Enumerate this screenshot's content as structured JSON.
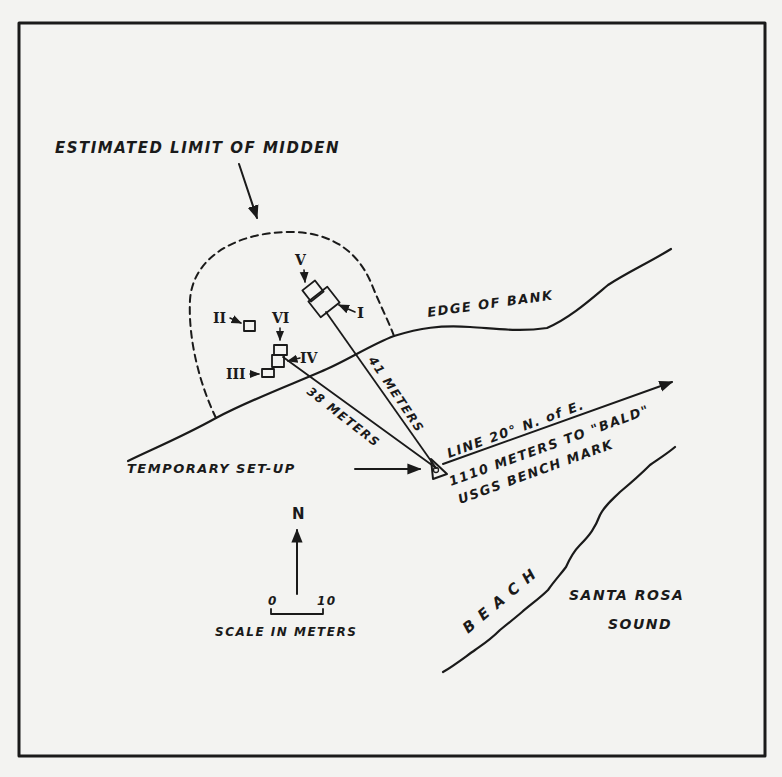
{
  "map": {
    "title_label": "ESTIMATED LIMIT OF MIDDEN",
    "bank_label": "EDGE OF BANK",
    "setup_label": "TEMPORARY SET-UP",
    "line_label": "LINE 20° N. of E.",
    "distance_label_1": "1110 METERS TO \"BALD\"",
    "distance_label_2": "USGS BENCH MARK",
    "measure_41": "41 METERS",
    "measure_38": "38 METERS",
    "beach_label": "B E A C H",
    "water_label_1": "SANTA ROSA",
    "water_label_2": "SOUND",
    "north_label": "N",
    "scale_zero": "0",
    "scale_ten": "10",
    "scale_label": "SCALE IN METERS",
    "units": [
      {
        "id": "I",
        "label": "I"
      },
      {
        "id": "II",
        "label": "II"
      },
      {
        "id": "III",
        "label": "III"
      },
      {
        "id": "IV",
        "label": "IV"
      },
      {
        "id": "V",
        "label": "V"
      },
      {
        "id": "VI",
        "label": "VI"
      }
    ]
  }
}
